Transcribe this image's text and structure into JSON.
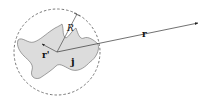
{
  "diagram": {
    "labels": {
      "field_vector": "r",
      "source_vector": "r'",
      "radius": "R",
      "current": "j"
    },
    "colors": {
      "blob_fill": "#dcdcdc",
      "stroke": "#333333",
      "circle": "#555555"
    }
  }
}
